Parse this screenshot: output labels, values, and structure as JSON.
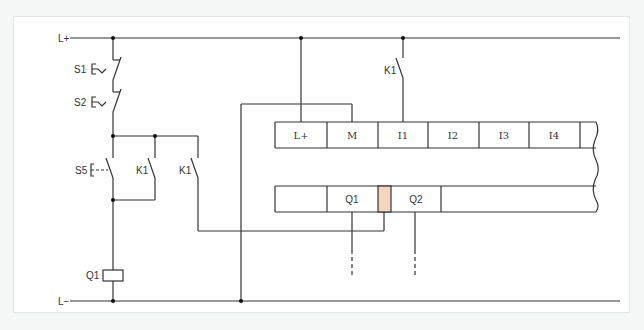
{
  "diagram": {
    "rails": {
      "positive": "L+",
      "negative": "L−"
    },
    "components": {
      "s1": "S1",
      "s2": "S2",
      "s5": "S5",
      "k1_hold": "K1",
      "k1_plc": "K1",
      "k1_input": "K1",
      "coil_q1": "Q1"
    },
    "plc": {
      "input_terminals": [
        "L+",
        "M",
        "I1",
        "I2",
        "I3",
        "I4"
      ],
      "output_terminals": [
        "Q1",
        "Q2"
      ],
      "highlight_color": "#f5d5bd"
    },
    "colors": {
      "wire": "#333333",
      "frame_border": "#e4e6e6",
      "background": "#ffffff"
    }
  }
}
